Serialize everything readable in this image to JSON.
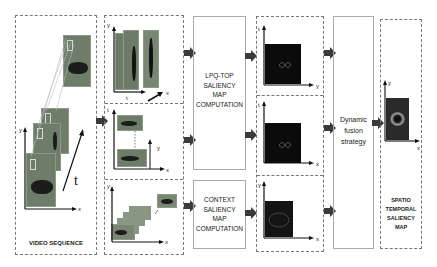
{
  "diagram": {
    "video_sequence": {
      "label": "VIDEO SEQUENCE",
      "axes": {
        "x": "x",
        "y": "y",
        "t": "t"
      }
    },
    "slices": [
      {
        "name": "x-t slice",
        "axes": {
          "vertical": "y",
          "horizontal": "t",
          "depth": "x"
        }
      },
      {
        "name": "y-t slice",
        "axes": {
          "vertical": "t",
          "horizontal": "x",
          "depth": "y"
        }
      },
      {
        "name": "x-y frames",
        "axes": {
          "vertical": "y",
          "horizontal": "x"
        }
      }
    ],
    "lpq_box": {
      "lines": [
        "LPQ-TOP",
        "SALIENCY",
        "MAP",
        "COMPUTATION"
      ]
    },
    "context_box": {
      "lines": [
        "CONTEXT",
        "SALIENCY",
        "MAP",
        "COMPUTATION"
      ]
    },
    "saliency_maps": [
      {
        "axes": {
          "vertical": "t",
          "horizontal": "y"
        }
      },
      {
        "axes": {
          "vertical": "t",
          "horizontal": "x"
        }
      },
      {
        "axes": {
          "vertical": "y",
          "horizontal": "x"
        }
      }
    ],
    "fusion_box": {
      "lines": [
        "Dynamic",
        "fusion",
        "strategy"
      ]
    },
    "output": {
      "label_lines": [
        "SPATIO",
        "TEMPORAL",
        "SALIENCY",
        "MAP"
      ],
      "axes": {
        "vertical": "y",
        "horizontal": "x"
      }
    },
    "colors": {
      "arrow": "#3a3a3a",
      "dashed_border": "#777777",
      "map_background": "#0b0b0b",
      "frame_fill": "#6d7d6a"
    }
  }
}
